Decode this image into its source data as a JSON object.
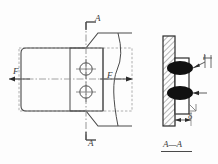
{
  "drawing": {
    "title": "welded-joint-detail",
    "views": {
      "main": {
        "name": "front-view",
        "section_mark_top": "A",
        "section_mark_bottom": "A",
        "force_left": "F",
        "force_right": "F",
        "hole_count": 2
      },
      "section": {
        "name": "section-view",
        "caption": "A—A",
        "weld_length_label": "l",
        "thickness_label": "δ",
        "weld_count": 2
      }
    },
    "colors": {
      "line": "#4a4a4a",
      "thin_line": "#6e6e6e",
      "dashed": "#8a8a8a",
      "weld_fill": "#111111",
      "hatch": "#4a4a4a",
      "background": "#fdfdfd"
    }
  }
}
